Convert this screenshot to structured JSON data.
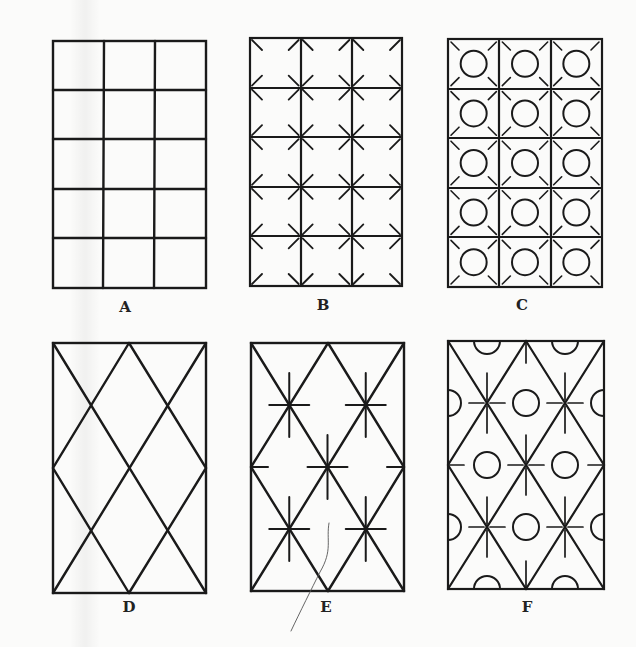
{
  "figure": {
    "ink_color": "#1a1a1a",
    "panels": [
      {
        "label": "A",
        "type": "square-grid",
        "cols": 3,
        "rows": 5,
        "marks": "none",
        "box": [
          53,
          41,
          153,
          247
        ]
      },
      {
        "label": "B",
        "type": "square-grid",
        "cols": 3,
        "rows": 5,
        "marks": "x-stubs-at-intersections",
        "box": [
          250,
          38,
          152,
          248
        ]
      },
      {
        "label": "C",
        "type": "square-grid",
        "cols": 3,
        "rows": 5,
        "marks": "x-stubs-at-intersections-and-circles-in-cells",
        "box": [
          448,
          39,
          154,
          248
        ]
      },
      {
        "label": "D",
        "type": "diamond-lattice",
        "marks": "none",
        "box": [
          53,
          343,
          153,
          250
        ]
      },
      {
        "label": "E",
        "type": "diamond-lattice",
        "marks": "plus-crosses-at-intersections",
        "box": [
          251,
          343,
          153,
          248
        ]
      },
      {
        "label": "F",
        "type": "diamond-lattice",
        "marks": "plus-crosses-and-circles-with-half-circles-at-edges",
        "box": [
          448,
          341,
          156,
          248
        ]
      }
    ]
  },
  "labels": {
    "a": "A",
    "b": "B",
    "c": "C",
    "d": "D",
    "e": "E",
    "f": "F"
  }
}
